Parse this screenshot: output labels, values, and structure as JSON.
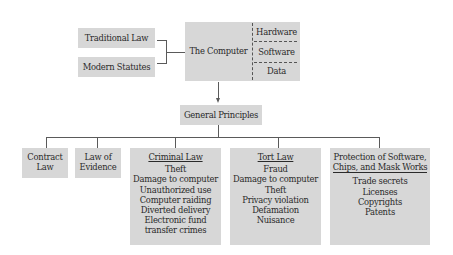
{
  "diagram": {
    "sources": {
      "traditional_law": "Traditional Law",
      "modern_statutes": "Modern Statutes"
    },
    "computer": {
      "label": "The Computer",
      "parts": [
        "Hardware",
        "Software",
        "Data"
      ]
    },
    "general_principles": "General Principles",
    "branches": [
      {
        "title_line1": "Contract",
        "title_line2": "Law"
      },
      {
        "title_line1": "Law of",
        "title_line2": "Evidence"
      },
      {
        "title": "Criminal Law",
        "items": [
          "Theft",
          "Damage to computer",
          "Unauthorized use",
          "Computer raiding",
          "Diverted delivery",
          "Electronic fund",
          "transfer crimes"
        ]
      },
      {
        "title": "Tort Law",
        "items": [
          "Fraud",
          "Damage to computer",
          "Theft",
          "Privacy violation",
          "Defamation",
          "Nuisance"
        ]
      },
      {
        "title_line1": "Protection of Software,",
        "title_line2": "Chips, and Mask Works",
        "items": [
          "Trade secrets",
          "Licenses",
          "Copyrights",
          "Patents"
        ]
      }
    ]
  },
  "colors": {
    "box_fill": "#d7d7d7",
    "line": "#5a5a5a",
    "background": "#ffffff"
  }
}
